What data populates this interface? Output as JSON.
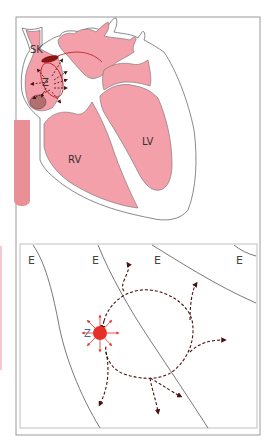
{
  "figure": {
    "top_panel": {
      "title": "heart-conduction-overview",
      "labels": {
        "sa_node": "SK",
        "ectopic_focus": "Z",
        "right_ventricle": "RV",
        "left_ventricle": "LV"
      }
    },
    "bottom_panel": {
      "title": "ectopic-focus-reentry-detail",
      "labels": {
        "excitation_fronts": [
          "E",
          "E",
          "E",
          "E"
        ],
        "ectopic_focus": "Z"
      }
    },
    "colors": {
      "myocardium": "#f4a0aa",
      "myocardium_light": "#f7b8bf",
      "outline": "#6b6b6b",
      "sa_node": "#8a1515",
      "conduction_line": "#c0262a",
      "av_node": "#b07070",
      "focus_dot": "#e5302a",
      "arrow_dark": "#5a1010",
      "z_label": "#4a6a96",
      "frame": "#9a9a9a"
    }
  }
}
